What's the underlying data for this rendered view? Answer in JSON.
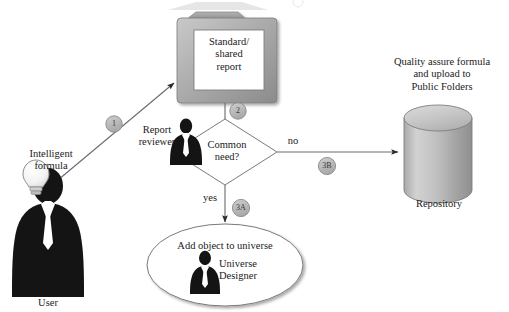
{
  "diagram": {
    "title_cut_off": "",
    "nodes": {
      "user": {
        "icon": "user-silhouette-icon",
        "label": "User",
        "annotation": "Intelligent\nformula",
        "annotation_icon": "lightbulb-icon"
      },
      "report": {
        "icon": "folder-icon",
        "label": "Standard/\nshared\nreport"
      },
      "reviewer": {
        "icon": "person-silhouette-icon",
        "label": "Report\nreviewer"
      },
      "decision": {
        "shape": "diamond",
        "label": "Common\nneed?"
      },
      "universe": {
        "shape": "ellipse",
        "label": "Add object to universe",
        "role_label": "Universe\nDesigner",
        "role_icon": "person-silhouette-icon"
      },
      "repository": {
        "icon": "cylinder-database-icon",
        "label": "Repository",
        "annotation": "Quality assure formula\nand upload to\nPublic Folders"
      }
    },
    "edges": [
      {
        "id": "e1",
        "badge": "1",
        "from": "user",
        "to": "report",
        "edge_label": ""
      },
      {
        "id": "e2",
        "badge": "2",
        "from": "report",
        "to": "decision",
        "edge_label": ""
      },
      {
        "id": "e3a",
        "badge": "3A",
        "from": "decision",
        "to": "universe",
        "edge_label": "yes"
      },
      {
        "id": "e3b",
        "badge": "3B",
        "from": "decision",
        "to": "repository",
        "edge_label": "no"
      }
    ],
    "colors": {
      "ink": "#1a1a1a",
      "stroke": "#6e6e6e",
      "badge_fill": "#b9b9b9",
      "badge_stroke": "#8a8a8a",
      "folder_light": "#c8c8c8",
      "folder_dark": "#8e8e8e",
      "cylinder_light": "#d6d6d6",
      "cylinder_dark": "#9a9a9a",
      "silhouette": "#141414",
      "paper": "#ffffff"
    }
  }
}
